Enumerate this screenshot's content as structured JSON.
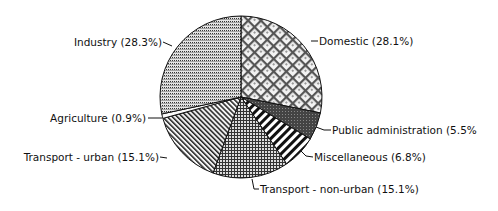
{
  "chart_data": {
    "type": "pie",
    "title": "",
    "start_angle_deg": 0,
    "direction": "clockwise",
    "categories": [
      "Domestic",
      "Public administration",
      "Miscellaneous",
      "Transport - non-urban",
      "Transport - urban",
      "Agriculture",
      "Industry"
    ],
    "values": [
      28.1,
      5.5,
      6.8,
      15.1,
      15.1,
      0.9,
      28.3
    ],
    "labels": [
      "Domestic (28.1%)",
      "Public administration (5.5%",
      "Miscellaneous (6.8%)",
      "Transport - non-urban (15.1%)",
      "Transport - urban (15.1%)",
      "Agriculture (0.9%)",
      "Industry (28.3%)"
    ],
    "patterns": [
      "diamond-crosshatch",
      "dense-dark",
      "bold-diagonal-stripes",
      "fine-grid",
      "diagonal-stripes",
      "blank",
      "horizontal-dotted-lines"
    ],
    "legend": "none",
    "grid": false
  }
}
